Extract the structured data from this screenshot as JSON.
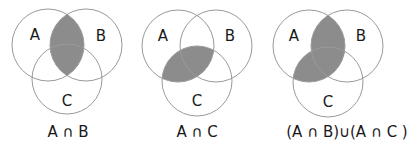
{
  "colors": {
    "shade": "#8c8c8c",
    "outline": "#9a9a9a",
    "text": "#1a1a1a",
    "background": "#ffffff"
  },
  "diagrams": [
    {
      "caption": "A ∩ B",
      "sets": {
        "a": "A",
        "b": "B",
        "c": "C"
      },
      "shaded_regions": [
        "A∩B"
      ]
    },
    {
      "caption": "A ∩ C",
      "sets": {
        "a": "A",
        "b": "B",
        "c": "C"
      },
      "shaded_regions": [
        "A∩C"
      ]
    },
    {
      "caption": "(A ∩ B)∪(A ∩ C )",
      "sets": {
        "a": "A",
        "b": "B",
        "c": "C"
      },
      "shaded_regions": [
        "A∩B",
        "A∩C"
      ]
    }
  ]
}
